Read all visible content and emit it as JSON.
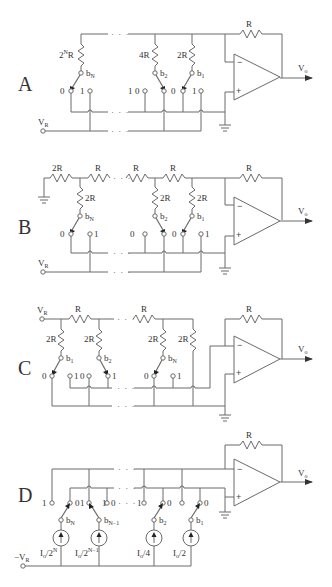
{
  "figure": {
    "panels": [
      {
        "id": "A",
        "label": "A",
        "feedback_resistor": "R",
        "output": "V",
        "output_sub": "o",
        "ref": "V",
        "ref_sub": "R",
        "branches": [
          {
            "resistor": "2",
            "resistor_sup": "N",
            "resistor_suffix": "R",
            "bit": "b",
            "bit_sub": "N"
          },
          {
            "resistor": "4R",
            "bit": "b",
            "bit_sub": "2"
          },
          {
            "resistor": "2R",
            "bit": "b",
            "bit_sub": "1"
          }
        ],
        "switch_labels": [
          "0",
          "1",
          "1",
          "0",
          "0",
          "1"
        ],
        "ellipsis": "· · ·",
        "opamp_minus": "−",
        "opamp_plus": "+"
      },
      {
        "id": "B",
        "label": "B",
        "ladder": [
          "2R",
          "R",
          "R",
          "R"
        ],
        "shunts": [
          "2R",
          "2R",
          "2R"
        ],
        "feedback_resistor": "R",
        "output": "V",
        "output_sub": "o",
        "ref": "V",
        "ref_sub": "R",
        "bits": [
          {
            "b": "b",
            "sub": "N"
          },
          {
            "b": "b",
            "sub": "2"
          },
          {
            "b": "b",
            "sub": "1"
          }
        ],
        "switch_labels": [
          "0",
          "1",
          "0",
          "0",
          "1"
        ],
        "ellipsis": "· · ·",
        "opamp_minus": "−",
        "opamp_plus": "+"
      },
      {
        "id": "C",
        "label": "C",
        "ladder": [
          "R",
          "R"
        ],
        "shunts": [
          "2R",
          "2R",
          "2R",
          "2R"
        ],
        "feedback_resistor": "R",
        "output": "V",
        "output_sub": "o",
        "ref": "V",
        "ref_sub": "R",
        "bits": [
          {
            "b": "b",
            "sub": "1"
          },
          {
            "b": "b",
            "sub": "2"
          },
          {
            "b": "b",
            "sub": "N"
          }
        ],
        "switch_labels": [
          "0",
          "1",
          "0",
          "1",
          "0",
          "1"
        ],
        "ellipsis": "· · ·",
        "opamp_minus": "−",
        "opamp_plus": "+"
      },
      {
        "id": "D",
        "label": "D",
        "feedback_resistor": "R",
        "output": "V",
        "output_sub": "o",
        "ref": "−V",
        "ref_sub": "R",
        "bits": [
          {
            "b": "b",
            "sub": "N"
          },
          {
            "b": "b",
            "sub": "N−1"
          },
          {
            "b": "b",
            "sub": "2"
          },
          {
            "b": "b",
            "sub": "1"
          }
        ],
        "sources": [
          {
            "base": "I",
            "base_sub": "o",
            "div": "/2",
            "sup": "N"
          },
          {
            "base": "I",
            "base_sub": "o",
            "div": "/2",
            "sup": "N−1"
          },
          {
            "base": "I",
            "base_sub": "o",
            "div": "/4",
            "sup": ""
          },
          {
            "base": "I",
            "base_sub": "o",
            "div": "/2",
            "sup": ""
          }
        ],
        "switch_labels": [
          "1",
          "0",
          "1",
          "1",
          "0",
          "1",
          "0",
          "0"
        ],
        "ellipsis": "· · ·",
        "opamp_minus": "−",
        "opamp_plus": "+"
      }
    ]
  }
}
